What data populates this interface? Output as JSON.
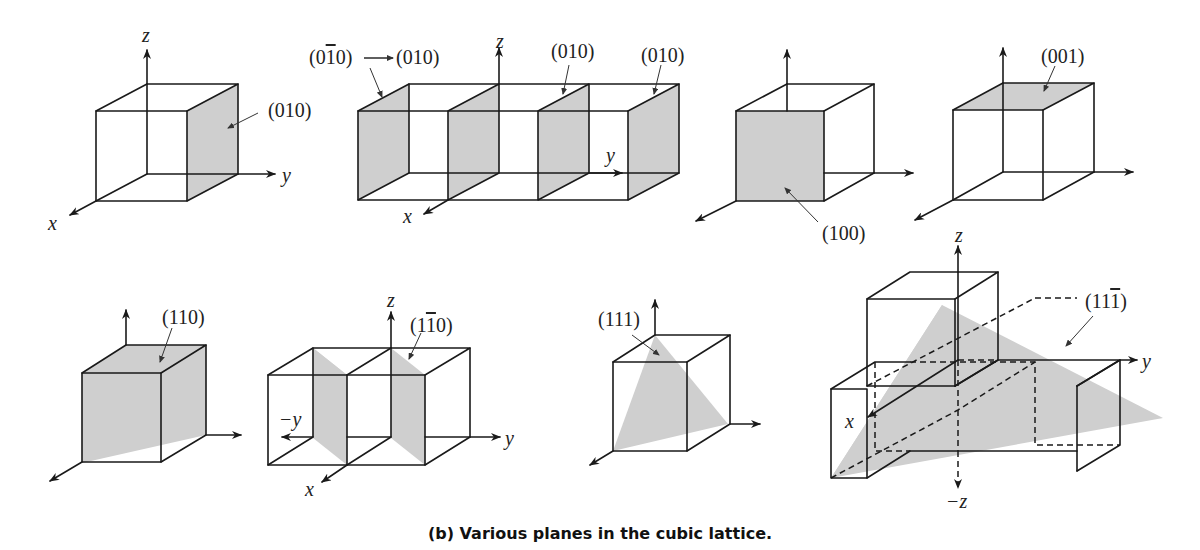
{
  "figure": {
    "caption": "(b) Various planes in the cubic lattice.",
    "fill_color": "#cfcfcf",
    "line_color": "#1a1a1a"
  },
  "panels": [
    {
      "id": "p1",
      "plane_labels": [
        "(010)"
      ],
      "axes": [
        "z",
        "y",
        "x"
      ]
    },
    {
      "id": "p2",
      "plane_labels": [
        "(0̅0)→(010)",
        "(010)",
        "(010)"
      ],
      "axes": [
        "z",
        "y",
        "x"
      ]
    },
    {
      "id": "p3",
      "plane_labels": [
        "(100)"
      ],
      "axes": []
    },
    {
      "id": "p4",
      "plane_labels": [
        "(001)"
      ],
      "axes": []
    },
    {
      "id": "p5",
      "plane_labels": [
        "(110)"
      ],
      "axes": []
    },
    {
      "id": "p6",
      "plane_labels": [
        "(11̅0)"
      ],
      "axes": [
        "z",
        "−y",
        "y",
        "x"
      ]
    },
    {
      "id": "p7",
      "plane_labels": [
        "(111)"
      ],
      "axes": []
    },
    {
      "id": "p8",
      "plane_labels": [
        "(111̅)"
      ],
      "axes": [
        "z",
        "y",
        "x",
        "−z"
      ]
    }
  ],
  "labels": {
    "p1_plane": "(010)",
    "p2_a": "(0",
    "p2_a_bar": "1",
    "p2_a_rest": "0)",
    "p2_a_to": "(010)",
    "p2_b": "(010)",
    "p2_c": "(010)",
    "p3_plane": "(100)",
    "p4_plane": "(001)",
    "p5_plane": "(110)",
    "p6_pre": "(1",
    "p6_bar": "1",
    "p6_post": "0)",
    "p7_plane": "(111)",
    "p8_pre": "(11",
    "p8_bar": "1",
    "p8_post": ")",
    "ax_z": "z",
    "ax_y": "y",
    "ax_x": "x",
    "ax_neg_y": "−y",
    "ax_neg_z": "−z"
  }
}
